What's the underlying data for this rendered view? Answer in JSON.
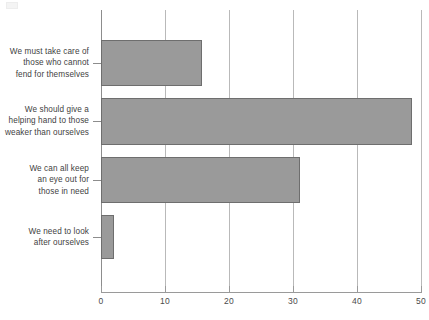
{
  "chart_data": {
    "type": "bar",
    "orientation": "horizontal",
    "title": "",
    "subtitle": "",
    "xlabel": "",
    "ylabel": "",
    "xlim": [
      0,
      50
    ],
    "xticks": [
      0,
      10,
      20,
      30,
      40,
      50
    ],
    "xtick_labels": [
      "0",
      "10",
      "20",
      "30",
      "40",
      "50"
    ],
    "grid": "vertical",
    "legend": "none",
    "categories": [
      "We must take care of those who cannot fend for themselves",
      "We should give a helping hand to those weaker than ourselves",
      "We can all keep an eye out for those in need",
      "We need to look after ourselves"
    ],
    "category_lines": [
      [
        "We must take care of",
        "those who cannot",
        "fend for themselves"
      ],
      [
        "We should give a",
        "helping hand to those",
        "weaker than ourselves"
      ],
      [
        "We can all keep",
        "an eye out for",
        "those in need"
      ],
      [
        "We need to look",
        "after ourselves"
      ]
    ],
    "values": [
      15.8,
      48.6,
      31.1,
      2.0
    ],
    "bar_color": "#9a9a9a",
    "bar_border_color": "#6e6e6e",
    "gridline_color": "#b9b9b9",
    "axis_color": "#8d8d8d",
    "text_color": "#3f3f3f",
    "background_color": "#ffffff"
  }
}
